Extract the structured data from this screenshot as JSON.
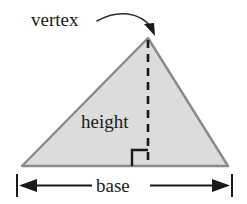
{
  "figure": {
    "shape": "triangle",
    "labels": {
      "vertex": "vertex",
      "height": "height",
      "base": "base"
    },
    "colors": {
      "triangle_fill": "#dcdcdc",
      "triangle_stroke": "#8a8a8a",
      "line_color": "#1a1a1a",
      "text_color": "#1a1a1a",
      "background": "#ffffff"
    },
    "geometry": {
      "apex": [
        148,
        38
      ],
      "bottom_left": [
        22,
        166
      ],
      "bottom_right": [
        228,
        166
      ],
      "height_foot": [
        148,
        166
      ],
      "dimension_line_y": 185,
      "dimension_left_x": 17,
      "dimension_right_x": 232
    },
    "annotations": {
      "vertex_arrow": "curved-arrow-pointing-to-apex",
      "height_line": "dashed-vertical-altitude",
      "right_angle": "right-angle-marker-at-base",
      "base_dimension": "double-headed-arrow-with-end-ticks"
    }
  }
}
